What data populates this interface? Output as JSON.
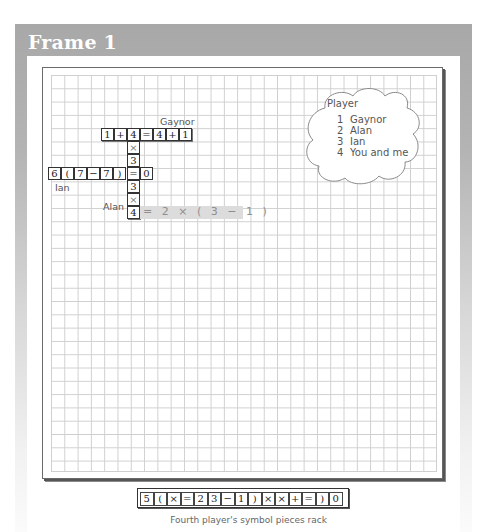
{
  "frame": {
    "title": "Frame 1"
  },
  "board": {
    "labels": {
      "gaynor": "Gaynor",
      "ian": "Ian",
      "alan": "Alan"
    },
    "row_gaynor": [
      "1",
      "+",
      "4",
      "=",
      "4",
      "+",
      "1"
    ],
    "column_alan": [
      "×",
      "3"
    ],
    "row_ian": [
      "6",
      "(",
      "7",
      "−",
      "7",
      ")",
      "=",
      "0"
    ],
    "column_lower": [
      "3",
      "×",
      "4"
    ],
    "proposed_move": "= 2 × ( 3 − 1 )"
  },
  "legend": {
    "title": "Player",
    "players": [
      {
        "num": "1",
        "name": "Gaynor"
      },
      {
        "num": "2",
        "name": "Alan"
      },
      {
        "num": "3",
        "name": "Ian"
      },
      {
        "num": "4",
        "name": "You and me"
      }
    ]
  },
  "rack": {
    "tiles": [
      "5",
      "(",
      "×",
      "=",
      "2",
      "3",
      "−",
      "1",
      ")",
      "×",
      "×",
      "+",
      "=",
      ")",
      "0"
    ],
    "caption": "Fourth player's symbol pieces rack"
  },
  "colors": {
    "frame_gray": "#a8a8a8",
    "grid_line": "#cfcfcf",
    "highlight": "#dcdcdc"
  }
}
